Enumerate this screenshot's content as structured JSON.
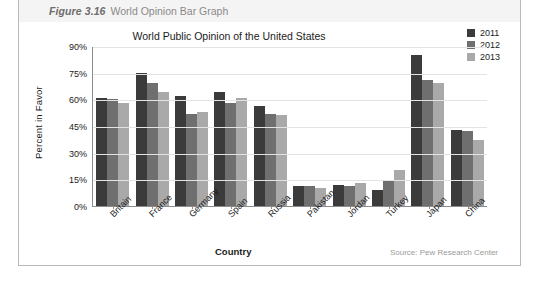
{
  "caption": {
    "number": "Figure 3.16",
    "text": "World Opinion Bar Graph"
  },
  "source_note": "Source: Pew Research Center",
  "colors": {
    "series_2011": "#3b3b3b",
    "series_2012": "#6f6f6f",
    "series_2013": "#a9a9a9",
    "axis": "#8c8c8c",
    "grid": "#e3e3e3",
    "caption_bg": "#f4f4f4",
    "frame": "#b9b9b9"
  },
  "chart_data": {
    "type": "bar",
    "title": "World Public Opinion of the United States",
    "xlabel": "Country",
    "ylabel": "Percent in Favor",
    "ylim": [
      0,
      90
    ],
    "ytick_labels": [
      "0%",
      "15%",
      "30%",
      "45%",
      "60%",
      "75%",
      "90%"
    ],
    "ytick_values": [
      0,
      15,
      30,
      45,
      60,
      75,
      90
    ],
    "grid": true,
    "legend_position": "top-right",
    "categories": [
      "Britain",
      "France",
      "Germany",
      "Spain",
      "Russia",
      "Pakistan",
      "Jordan",
      "Turkey",
      "Japan",
      "China"
    ],
    "series": [
      {
        "name": "2011",
        "values": [
          61,
          75,
          62,
          64,
          56,
          11,
          12,
          9,
          85,
          43
        ]
      },
      {
        "name": "2012",
        "values": [
          60,
          69,
          52,
          58,
          52,
          11,
          11,
          14,
          71,
          42
        ]
      },
      {
        "name": "2013",
        "values": [
          58,
          64,
          53,
          61,
          51,
          10,
          13,
          20,
          69,
          37
        ]
      }
    ]
  }
}
